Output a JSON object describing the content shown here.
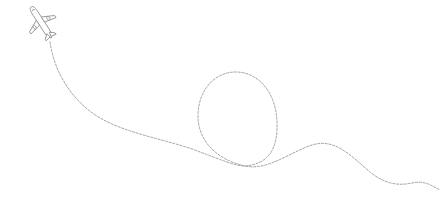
{
  "illustration": {
    "subject": "airplane with dashed flight path loop",
    "colors": {
      "background": "#ffffff",
      "stroke": "#9a9a9a",
      "plane_fill": "#ffffff"
    },
    "icons": [
      "airplane-icon"
    ]
  }
}
